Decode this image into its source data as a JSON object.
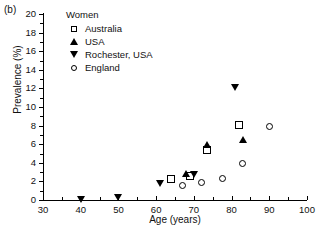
{
  "panel": {
    "label": "(b)"
  },
  "legend": {
    "title": "Women",
    "items": [
      {
        "label": "Australia",
        "marker": "open-square",
        "color": "#000000"
      },
      {
        "label": "USA",
        "marker": "filled-triangle-up",
        "color": "#000000"
      },
      {
        "label": "Rochester, USA",
        "marker": "filled-triangle-down",
        "color": "#000000"
      },
      {
        "label": "England",
        "marker": "open-circle",
        "color": "#000000"
      }
    ]
  },
  "chart_data": {
    "type": "scatter",
    "title": "Women",
    "xlabel": "Age (years)",
    "ylabel": "Prevalence (%)",
    "xlim": [
      30,
      100
    ],
    "ylim": [
      0,
      20
    ],
    "xticks": [
      30,
      40,
      50,
      60,
      70,
      80,
      90,
      100
    ],
    "yticks": [
      0,
      2,
      4,
      6,
      8,
      10,
      12,
      14,
      16,
      18,
      20
    ],
    "xtick_minor_step": 5,
    "ytick_minor_step": 1,
    "grid": false,
    "legend_position": "top-left-inside",
    "series": [
      {
        "name": "Australia",
        "marker": "open-square",
        "points": [
          {
            "x": 64,
            "y": 2.3
          },
          {
            "x": 69,
            "y": 2.6
          },
          {
            "x": 73.5,
            "y": 5.4
          },
          {
            "x": 82,
            "y": 8.1
          }
        ]
      },
      {
        "name": "USA",
        "marker": "filled-triangle-up",
        "points": [
          {
            "x": 68,
            "y": 2.9
          },
          {
            "x": 73.5,
            "y": 6.0
          },
          {
            "x": 83,
            "y": 6.5
          }
        ]
      },
      {
        "name": "Rochester, USA",
        "marker": "filled-triangle-down",
        "points": [
          {
            "x": 40,
            "y": 0.1
          },
          {
            "x": 50,
            "y": 0.3
          },
          {
            "x": 61,
            "y": 1.8
          },
          {
            "x": 70,
            "y": 2.7
          },
          {
            "x": 81,
            "y": 12.1
          }
        ]
      },
      {
        "name": "England",
        "marker": "open-circle",
        "points": [
          {
            "x": 67,
            "y": 1.6
          },
          {
            "x": 72,
            "y": 1.9
          },
          {
            "x": 77.5,
            "y": 2.3
          },
          {
            "x": 83,
            "y": 3.9
          },
          {
            "x": 90,
            "y": 7.9
          }
        ]
      }
    ]
  }
}
